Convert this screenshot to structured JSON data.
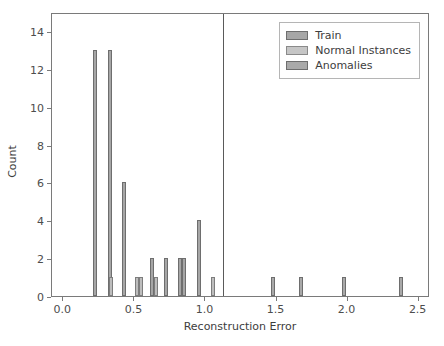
{
  "chart_data": {
    "type": "bar",
    "title": "",
    "xlabel": "Reconstruction Error",
    "ylabel": "Count",
    "xlim": [
      -0.08,
      2.58
    ],
    "ylim": [
      0,
      15
    ],
    "xticks": [
      0.0,
      0.5,
      1.0,
      1.5,
      2.0,
      2.5
    ],
    "xticklabels": [
      "0.0",
      "0.5",
      "1.0",
      "1.5",
      "2.0",
      "2.5"
    ],
    "yticks": [
      0,
      2,
      4,
      6,
      8,
      10,
      12,
      14
    ],
    "yticklabels": [
      "0",
      "2",
      "4",
      "6",
      "8",
      "10",
      "12",
      "14"
    ],
    "grid": false,
    "legend_position": "upper right",
    "bar_width": 0.022,
    "annotations": [
      {
        "name": "threshold-line",
        "type": "vline",
        "x": 1.12,
        "color": "#5a5a5a"
      }
    ],
    "series": [
      {
        "name": "Train",
        "color": "#a6a6a6",
        "points": [
          {
            "x": 0.225,
            "y": 13
          },
          {
            "x": 0.325,
            "y": 13
          },
          {
            "x": 0.425,
            "y": 6
          },
          {
            "x": 0.625,
            "y": 2
          },
          {
            "x": 0.725,
            "y": 2
          },
          {
            "x": 0.822,
            "y": 2
          },
          {
            "x": 0.852,
            "y": 2
          },
          {
            "x": 0.952,
            "y": 4
          }
        ]
      },
      {
        "name": "Normal Instances",
        "color": "#c6c6c6",
        "points": [
          {
            "x": 0.338,
            "y": 1
          },
          {
            "x": 0.515,
            "y": 1
          },
          {
            "x": 0.545,
            "y": 1
          },
          {
            "x": 0.652,
            "y": 1
          },
          {
            "x": 1.052,
            "y": 1
          }
        ]
      },
      {
        "name": "Anomalies",
        "color": "#a9a9a9",
        "points": [
          {
            "x": 1.478,
            "y": 1
          },
          {
            "x": 1.672,
            "y": 1
          },
          {
            "x": 1.978,
            "y": 1
          },
          {
            "x": 2.378,
            "y": 1
          }
        ]
      }
    ]
  },
  "legend": {
    "items": [
      {
        "label": "Train",
        "key": "train"
      },
      {
        "label": "Normal Instances",
        "key": "normal"
      },
      {
        "label": "Anomalies",
        "key": "anom"
      }
    ]
  }
}
